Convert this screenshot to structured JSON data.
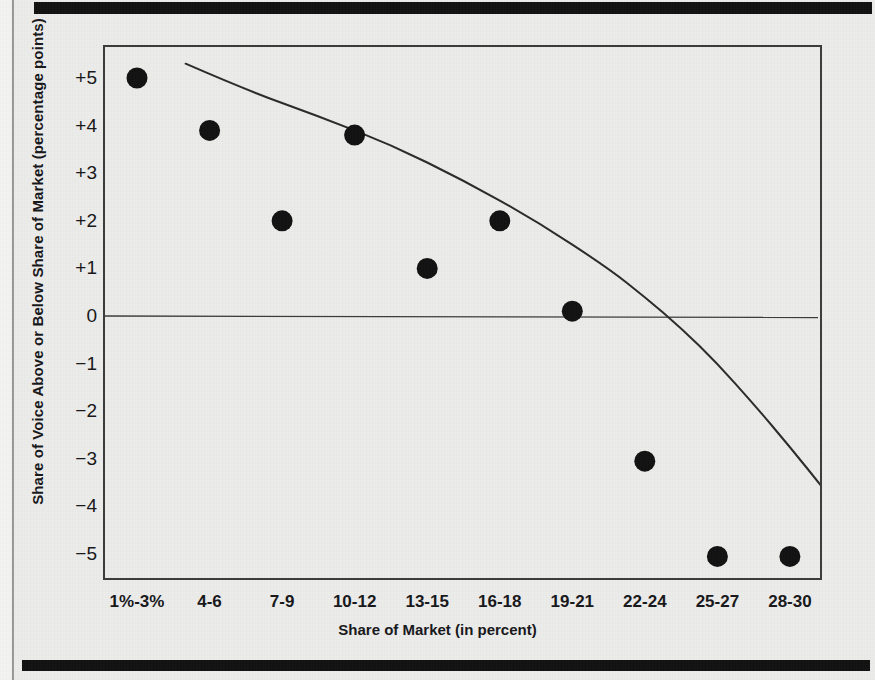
{
  "figure": {
    "background_color": "#ececeb",
    "ink_color": "#17171a",
    "marker_color": "#111111",
    "frame_color": "#3b3b3b"
  },
  "chart_data": {
    "type": "scatter",
    "title": "",
    "xlabel": "Share of Market (in percent)",
    "ylabel": "Share of Voice Above or Below Share of Market (percentage points)",
    "categories": [
      "1%-3%",
      "4-6",
      "7-9",
      "10-12",
      "13-15",
      "16-18",
      "19-21",
      "22-24",
      "25-27",
      "28-30"
    ],
    "values": [
      5.0,
      3.9,
      2.0,
      3.8,
      1.0,
      2.0,
      0.1,
      -3.05,
      -5.05,
      -5.05
    ],
    "ylim": [
      -5.6,
      5.6
    ],
    "ytick_labels": [
      "+5",
      "+4",
      "+3",
      "+2",
      "+1",
      "0",
      "-1",
      "-2",
      "-3",
      "-4",
      "-5"
    ],
    "ytick_values": [
      5,
      4,
      3,
      2,
      1,
      0,
      -1,
      -2,
      -3,
      -4,
      -5
    ],
    "grid": false,
    "legend": null,
    "zero_line": true,
    "trend_line": {
      "label": "fitted trend curve",
      "points": [
        [
          0.67,
          5.3
        ],
        [
          1.5,
          4.75
        ],
        [
          2.5,
          4.2
        ],
        [
          3.5,
          3.6
        ],
        [
          4.5,
          2.85
        ],
        [
          5.5,
          2.0
        ],
        [
          6.5,
          1.0
        ],
        [
          7.0,
          0.4
        ],
        [
          7.5,
          -0.25
        ],
        [
          8.0,
          -1.0
        ],
        [
          8.5,
          -1.85
        ],
        [
          9.0,
          -2.75
        ],
        [
          9.5,
          -3.7
        ],
        [
          10.0,
          -4.65
        ],
        [
          10.35,
          -5.4
        ]
      ]
    }
  }
}
